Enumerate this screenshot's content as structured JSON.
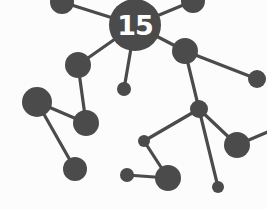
{
  "diagram": {
    "type": "molecule-network",
    "hub_label": "15",
    "colors": {
      "node": "#4b4b4b",
      "edge": "#4b4b4b",
      "background": "#fcfcfc",
      "label": "#ffffff"
    },
    "nodes": [
      {
        "id": "hub",
        "x": 135,
        "y": 25,
        "r": 26
      },
      {
        "id": "top-left",
        "x": 62,
        "y": 2,
        "r": 12
      },
      {
        "id": "top-right",
        "x": 193,
        "y": 1,
        "r": 12
      },
      {
        "id": "a",
        "x": 78,
        "y": 65,
        "r": 13
      },
      {
        "id": "small-below-hub",
        "x": 124,
        "y": 89,
        "r": 7
      },
      {
        "id": "b",
        "x": 185,
        "y": 51,
        "r": 13
      },
      {
        "id": "far-right",
        "x": 257,
        "y": 79,
        "r": 9
      },
      {
        "id": "big-left",
        "x": 37,
        "y": 102,
        "r": 15
      },
      {
        "id": "c",
        "x": 86,
        "y": 123,
        "r": 13
      },
      {
        "id": "d",
        "x": 75,
        "y": 169,
        "r": 12
      },
      {
        "id": "junction",
        "x": 199,
        "y": 109,
        "r": 9
      },
      {
        "id": "f",
        "x": 144,
        "y": 141,
        "r": 6
      },
      {
        "id": "g",
        "x": 237,
        "y": 145,
        "r": 13
      },
      {
        "id": "h",
        "x": 168,
        "y": 178,
        "r": 13
      },
      {
        "id": "i",
        "x": 127,
        "y": 175,
        "r": 7
      },
      {
        "id": "j",
        "x": 218,
        "y": 187,
        "r": 6
      }
    ],
    "edges": [
      [
        "hub",
        "top-left"
      ],
      [
        "hub",
        "top-right"
      ],
      [
        "hub",
        "a"
      ],
      [
        "hub",
        "small-below-hub"
      ],
      [
        "hub",
        "b"
      ],
      [
        "b",
        "far-right"
      ],
      [
        "b",
        "junction"
      ],
      [
        "a",
        "c"
      ],
      [
        "big-left",
        "c"
      ],
      [
        "big-left",
        "d"
      ],
      [
        "junction",
        "f"
      ],
      [
        "junction",
        "g"
      ],
      [
        "junction",
        "j"
      ],
      [
        "f",
        "h"
      ],
      [
        "h",
        "i"
      ]
    ]
  }
}
